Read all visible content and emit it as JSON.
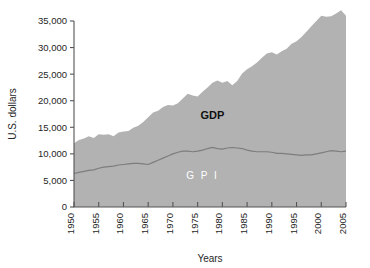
{
  "chart_data": {
    "type": "area",
    "title": "",
    "xlabel": "Years",
    "ylabel": "U.S. dollars",
    "xlim": [
      1950,
      2005
    ],
    "ylim": [
      0,
      35000
    ],
    "grid": false,
    "legend_position": "inline-annotation",
    "y_ticks": [
      0,
      5000,
      10000,
      15000,
      20000,
      25000,
      30000,
      35000
    ],
    "y_tick_labels": [
      "0",
      "5,000",
      "10,000",
      "15,000",
      "20,000",
      "25,000",
      "30,000",
      "35,000"
    ],
    "x_ticks": [
      1950,
      1955,
      1960,
      1965,
      1970,
      1975,
      1980,
      1985,
      1990,
      1995,
      2000,
      2005
    ],
    "x_tick_labels": [
      "1950",
      "1955",
      "1960",
      "1965",
      "1970",
      "1975",
      "1980",
      "1985",
      "1990",
      "1995",
      "2000",
      "2005"
    ],
    "annotations": [
      {
        "text": "GDP",
        "x": 1978,
        "y": 16500,
        "style": "bold-dark"
      },
      {
        "text": "G P I",
        "x": 1976,
        "y": 5200,
        "style": "white-spaced"
      }
    ],
    "colors": {
      "area_fill": "#b2b2b2",
      "gpi_line": "#7d7d7d",
      "axis": "#555555",
      "gdp_label": "#111111",
      "gpi_label": "#ffffff",
      "background": "#ffffff"
    },
    "x": [
      1950,
      1951,
      1952,
      1953,
      1954,
      1955,
      1956,
      1957,
      1958,
      1959,
      1960,
      1961,
      1962,
      1963,
      1964,
      1965,
      1966,
      1967,
      1968,
      1969,
      1970,
      1971,
      1972,
      1973,
      1974,
      1975,
      1976,
      1977,
      1978,
      1979,
      1980,
      1981,
      1982,
      1983,
      1984,
      1985,
      1986,
      1987,
      1988,
      1989,
      1990,
      1991,
      1992,
      1993,
      1994,
      1995,
      1996,
      1997,
      1998,
      1999,
      2000,
      2001,
      2002,
      2003,
      2004,
      2005
    ],
    "series": [
      {
        "name": "GDP",
        "values": [
          12000,
          12600,
          12900,
          13300,
          13000,
          13700,
          13600,
          13700,
          13300,
          14000,
          14200,
          14300,
          14900,
          15300,
          16000,
          16900,
          17800,
          18100,
          18800,
          19200,
          19100,
          19500,
          20400,
          21300,
          21000,
          20800,
          21700,
          22500,
          23400,
          23800,
          23400,
          23700,
          22900,
          23700,
          25100,
          25900,
          26500,
          27200,
          28100,
          28900,
          29100,
          28700,
          29300,
          29800,
          30700,
          31200,
          32000,
          33000,
          34000,
          35000,
          36000,
          35800,
          35900,
          36400,
          37000,
          36000
        ]
      },
      {
        "name": "GPI",
        "values": [
          6300,
          6500,
          6700,
          6900,
          7000,
          7300,
          7500,
          7600,
          7700,
          7900,
          8000,
          8100,
          8200,
          8200,
          8100,
          8000,
          8400,
          8800,
          9200,
          9600,
          10000,
          10300,
          10500,
          10500,
          10400,
          10500,
          10700,
          11000,
          11200,
          11000,
          10900,
          11100,
          11200,
          11100,
          11000,
          10700,
          10500,
          10400,
          10400,
          10400,
          10300,
          10100,
          10100,
          10000,
          9900,
          9800,
          9700,
          9800,
          9800,
          10000,
          10200,
          10400,
          10600,
          10500,
          10400,
          10500
        ]
      }
    ]
  }
}
